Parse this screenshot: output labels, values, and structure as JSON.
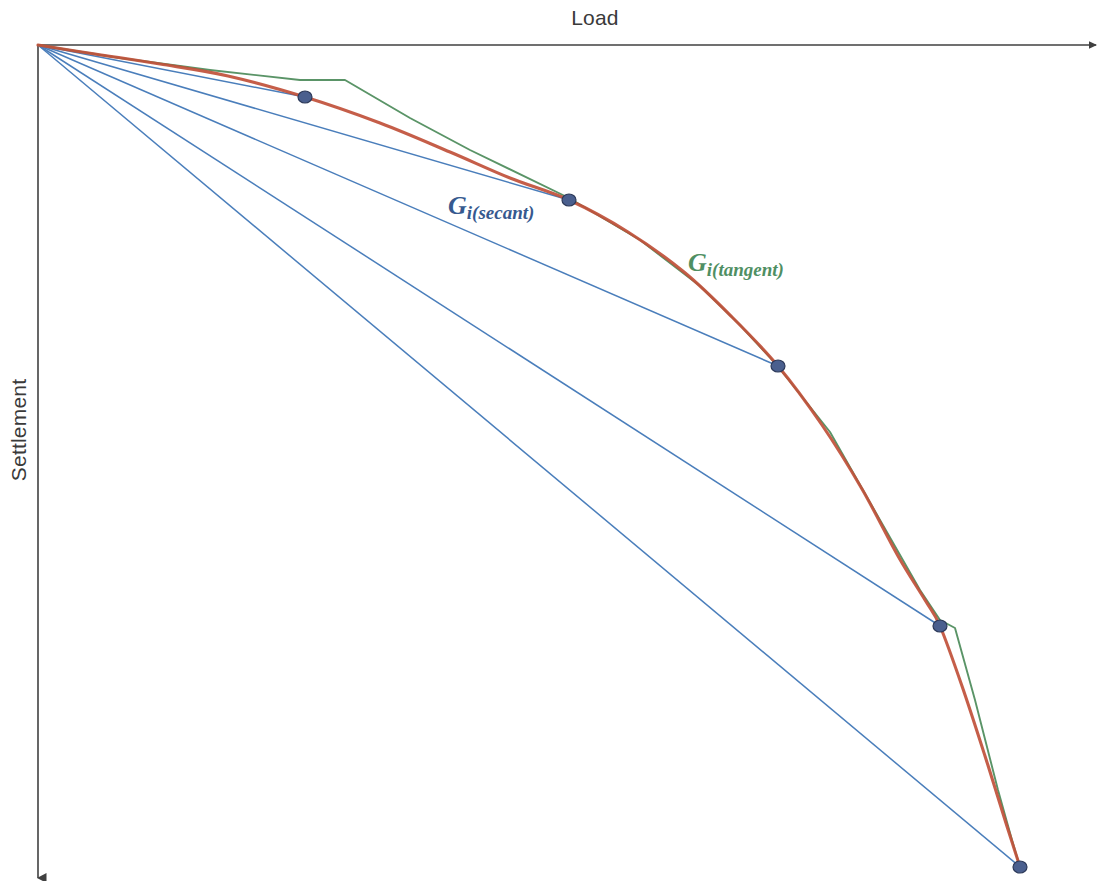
{
  "figure": {
    "type": "line-diagram",
    "background_color": "#ffffff",
    "axes": {
      "x_label": "Load",
      "x_label_pos": [
        595,
        25
      ],
      "y_label": "Settlement",
      "y_label_pos": [
        26,
        430
      ],
      "axis_color": "#404040",
      "origin": [
        38,
        45
      ],
      "x_axis_end": [
        1096,
        45
      ],
      "y_axis_end": [
        38,
        878
      ]
    },
    "annotations": [
      {
        "name": "secant-label",
        "base": "G",
        "subscript": "i(secant)",
        "color": "#36598f",
        "x": 448,
        "y": 214
      },
      {
        "name": "tangent-label",
        "base": "G",
        "subscript": "i(tangent)",
        "color": "#4f8f63",
        "x": 688,
        "y": 271
      }
    ],
    "colors": {
      "curve_red": "#c0503a",
      "polyline_green": "#5a9467",
      "secant_blue": "#4a7ebb",
      "marker_fill": "#4a5f8e",
      "marker_stroke": "#2d3a5a",
      "axis": "#404040",
      "text": "#3a3a3a"
    }
  },
  "chart_data": {
    "type": "line",
    "title": "",
    "subtitle": "",
    "xlabel": "Load",
    "ylabel": "Settlement",
    "xlim": [
      0,
      1102
    ],
    "ylim": [
      0,
      881
    ],
    "grid": false,
    "legend": "none",
    "axis_direction": {
      "x": "increasing to the right",
      "y": "increasing downward"
    },
    "note": "Schematic load-settlement curve showing secant and tangent stiffness construction. Coordinates are in screen pixels; no numeric tick labels are present on either axis.",
    "series": [
      {
        "name": "load-settlement-curve",
        "role": "measured curve",
        "color": "#c0503a",
        "style": "smooth",
        "points": [
          [
            38,
            45
          ],
          [
            95,
            54
          ],
          [
            160,
            64
          ],
          [
            228,
            76
          ],
          [
            305,
            97
          ],
          [
            380,
            123
          ],
          [
            450,
            152
          ],
          [
            510,
            178
          ],
          [
            569,
            200
          ],
          [
            628,
            232
          ],
          [
            684,
            272
          ],
          [
            732,
            317
          ],
          [
            778,
            366
          ],
          [
            822,
            425
          ],
          [
            862,
            489
          ],
          [
            898,
            556
          ],
          [
            925,
            600
          ],
          [
            940,
            626
          ],
          [
            962,
            686
          ],
          [
            985,
            756
          ],
          [
            1005,
            820
          ],
          [
            1020,
            867
          ]
        ]
      },
      {
        "name": "tangent-polyline",
        "role": "tangent stiffness construction",
        "color": "#5a9467",
        "style": "polyline",
        "points": [
          [
            38,
            45
          ],
          [
            120,
            58
          ],
          [
            210,
            70
          ],
          [
            300,
            80
          ],
          [
            345,
            80
          ],
          [
            410,
            118
          ],
          [
            470,
            150
          ],
          [
            569,
            198
          ],
          [
            640,
            240
          ],
          [
            700,
            286
          ],
          [
            740,
            325
          ],
          [
            776,
            364
          ],
          [
            830,
            432
          ],
          [
            880,
            520
          ],
          [
            920,
            590
          ],
          [
            940,
            620
          ],
          [
            955,
            628
          ],
          [
            975,
            700
          ],
          [
            998,
            790
          ],
          [
            1012,
            840
          ],
          [
            1020,
            867
          ]
        ]
      },
      {
        "name": "secant-line-1",
        "role": "secant from origin to point 1",
        "color": "#4a7ebb",
        "style": "straight",
        "points": [
          [
            38,
            45
          ],
          [
            305,
            97
          ]
        ]
      },
      {
        "name": "secant-line-2",
        "role": "secant from origin to point 2",
        "color": "#4a7ebb",
        "style": "straight",
        "points": [
          [
            38,
            45
          ],
          [
            569,
            200
          ]
        ]
      },
      {
        "name": "secant-line-3",
        "role": "secant from origin to point 3",
        "color": "#4a7ebb",
        "style": "straight",
        "points": [
          [
            38,
            45
          ],
          [
            778,
            366
          ]
        ]
      },
      {
        "name": "secant-line-4",
        "role": "secant from origin to point 4",
        "color": "#4a7ebb",
        "style": "straight",
        "points": [
          [
            38,
            45
          ],
          [
            940,
            626
          ]
        ]
      },
      {
        "name": "secant-line-5",
        "role": "secant from origin to point 5",
        "color": "#4a7ebb",
        "style": "straight",
        "points": [
          [
            38,
            45
          ],
          [
            1020,
            867
          ]
        ]
      }
    ],
    "markers": [
      {
        "name": "data-point-1",
        "x": 305,
        "y": 97
      },
      {
        "name": "data-point-2",
        "x": 569,
        "y": 200
      },
      {
        "name": "data-point-3",
        "x": 778,
        "y": 366
      },
      {
        "name": "data-point-4",
        "x": 940,
        "y": 626
      },
      {
        "name": "data-point-5",
        "x": 1020,
        "y": 867
      }
    ]
  }
}
